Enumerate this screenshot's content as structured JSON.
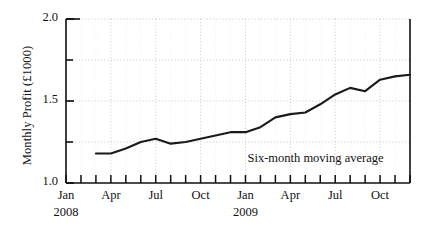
{
  "chart_data": {
    "type": "line",
    "title": "",
    "xlabel": "",
    "ylabel": "Monthly Profit (£1000)",
    "ylim": [
      1.0,
      2.0
    ],
    "y_major_ticks": [
      "1.0",
      "1.5",
      "2.0"
    ],
    "y_major_values": [
      1.0,
      1.5,
      2.0
    ],
    "y_minor_values": [
      1.25,
      1.75
    ],
    "grid": "dotted",
    "legend_position": "none",
    "annotations": [
      {
        "text": "Six-month moving average",
        "x_month": "2009-01",
        "y": 1.14
      }
    ],
    "x_tick_labels": [
      "Jan",
      "Apr",
      "Jul",
      "Oct",
      "Jan",
      "Apr",
      "Jul",
      "Oct"
    ],
    "x_year_labels": [
      "2008",
      "2009"
    ],
    "x_months": [
      "2008-01",
      "2008-02",
      "2008-03",
      "2008-04",
      "2008-05",
      "2008-06",
      "2008-07",
      "2008-08",
      "2008-09",
      "2008-10",
      "2008-11",
      "2008-12",
      "2009-01",
      "2009-02",
      "2009-03",
      "2009-04",
      "2009-05",
      "2009-06",
      "2009-07",
      "2009-08",
      "2009-09",
      "2009-10",
      "2009-11",
      "2009-12"
    ],
    "series": [
      {
        "name": "Six-month moving average",
        "color": "#1a1a1a",
        "x": [
          "2008-03",
          "2008-04",
          "2008-05",
          "2008-06",
          "2008-07",
          "2008-08",
          "2008-09",
          "2008-10",
          "2008-11",
          "2008-12",
          "2009-01",
          "2009-02",
          "2009-03",
          "2009-04",
          "2009-05",
          "2009-06",
          "2009-07",
          "2009-08",
          "2009-09",
          "2009-10"
        ],
        "values": [
          1.18,
          1.18,
          1.21,
          1.25,
          1.27,
          1.24,
          1.25,
          1.27,
          1.29,
          1.31,
          1.31,
          1.34,
          1.4,
          1.42,
          1.43,
          1.48,
          1.54,
          1.58,
          1.56,
          1.63
        ],
        "values_tail": [
          1.65,
          1.66
        ]
      }
    ]
  },
  "axis": {
    "y_labels": [
      {
        "text": "2.0",
        "value": 2.0
      },
      {
        "text": "1.5",
        "value": 1.5
      },
      {
        "text": "1.0",
        "value": 1.0
      }
    ],
    "x_labels": [
      {
        "text": "Jan",
        "month": "2008-01"
      },
      {
        "text": "Apr",
        "month": "2008-04"
      },
      {
        "text": "Jul",
        "month": "2008-07"
      },
      {
        "text": "Oct",
        "month": "2008-10"
      },
      {
        "text": "Jan",
        "month": "2009-01"
      },
      {
        "text": "Apr",
        "month": "2009-04"
      },
      {
        "text": "Jul",
        "month": "2009-07"
      },
      {
        "text": "Oct",
        "month": "2009-10"
      }
    ],
    "year_labels": [
      {
        "text": "2008",
        "month": "2008-01"
      },
      {
        "text": "2009",
        "month": "2009-01"
      }
    ]
  },
  "annotation": {
    "moving_average_label": "Six-month moving average"
  },
  "colors": {
    "line": "#1a1a1a",
    "axis": "#111111",
    "grid": "#b9b9b9",
    "background": "#ffffff"
  }
}
